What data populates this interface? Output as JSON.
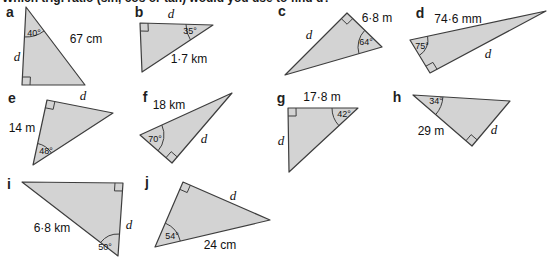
{
  "question_text": "Which trig. ratio (sin, cos or tan) would you use to find d?",
  "colors": {
    "triangle_fill": "#d3d3d3",
    "triangle_stroke": "#3d3d3d",
    "letter_color": "#1f1f1f",
    "label_color": "#111111"
  },
  "figure": {
    "right_angle_mark_size": 8,
    "triangles": [
      {
        "letter": "a",
        "letter_pos": [
          10,
          12
        ],
        "points": [
          [
            26,
            7
          ],
          [
            22,
            85
          ],
          [
            85,
            85
          ]
        ],
        "right_angle_vertex": 1,
        "angle": {
          "vertex": 0,
          "label": "40°",
          "label_pos": [
            34,
            33
          ],
          "radius": 30
        },
        "side_labels": [
          {
            "text": "67 cm",
            "pos": [
              86,
              39
            ],
            "italic": false
          },
          {
            "text": "d",
            "pos": [
              17,
              56
            ],
            "italic": true
          }
        ]
      },
      {
        "letter": "b",
        "letter_pos": [
          139,
          12
        ],
        "points": [
          [
            140,
            23
          ],
          [
            213,
            25
          ],
          [
            142,
            72
          ]
        ],
        "right_angle_vertex": 0,
        "angle": {
          "vertex": 1,
          "label": "35°",
          "label_pos": [
            190,
            31
          ],
          "radius": 27
        },
        "side_labels": [
          {
            "text": "d",
            "pos": [
              171,
              13
            ],
            "italic": true
          },
          {
            "text": "1·7 km",
            "pos": [
              189,
              59
            ],
            "italic": false
          }
        ]
      },
      {
        "letter": "c",
        "letter_pos": [
          282,
          11
        ],
        "points": [
          [
            285,
            75
          ],
          [
            347,
            13
          ],
          [
            382,
            47
          ]
        ],
        "right_angle_vertex": 1,
        "angle": {
          "vertex": 2,
          "label": "64°",
          "label_pos": [
            366,
            42
          ],
          "radius": 24
        },
        "side_labels": [
          {
            "text": "6·8 m",
            "pos": [
              377,
              18
            ],
            "italic": false
          },
          {
            "text": "d",
            "pos": [
              309,
              34
            ],
            "italic": true
          }
        ]
      },
      {
        "letter": "d",
        "letter_pos": [
          420,
          13
        ],
        "points": [
          [
            410,
            40
          ],
          [
            546,
            11
          ],
          [
            430,
            73
          ]
        ],
        "right_angle_vertex": 2,
        "angle": {
          "vertex": 0,
          "label": "75°",
          "label_pos": [
            422,
            46
          ],
          "radius": 18
        },
        "side_labels": [
          {
            "text": "74·6 mm",
            "pos": [
              458,
              19
            ],
            "italic": false
          },
          {
            "text": "d",
            "pos": [
              488,
              53
            ],
            "italic": true
          }
        ]
      },
      {
        "letter": "e",
        "letter_pos": [
          12,
          98
        ],
        "points": [
          [
            47,
            100
          ],
          [
            33,
            165
          ],
          [
            113,
            113
          ]
        ],
        "right_angle_vertex": 0,
        "angle": {
          "vertex": 1,
          "label": "48°",
          "label_pos": [
            46,
            151
          ],
          "radius": 22
        },
        "side_labels": [
          {
            "text": "14 m",
            "pos": [
              22,
              128
            ],
            "italic": false
          },
          {
            "text": "d",
            "pos": [
              83,
              95
            ],
            "italic": true
          }
        ]
      },
      {
        "letter": "f",
        "letter_pos": [
          145,
          97
        ],
        "points": [
          [
            140,
            135
          ],
          [
            232,
            93
          ],
          [
            172,
            163
          ]
        ],
        "right_angle_vertex": 2,
        "angle": {
          "vertex": 0,
          "label": "70°",
          "label_pos": [
            155,
            139
          ],
          "radius": 24
        },
        "side_labels": [
          {
            "text": "18 km",
            "pos": [
              169,
              105
            ],
            "italic": false
          },
          {
            "text": "d",
            "pos": [
              204,
              138
            ],
            "italic": true
          }
        ]
      },
      {
        "letter": "g",
        "letter_pos": [
          281,
          98
        ],
        "points": [
          [
            288,
            108
          ],
          [
            358,
            108
          ],
          [
            289,
            172
          ]
        ],
        "right_angle_vertex": 0,
        "angle": {
          "vertex": 1,
          "label": "42°",
          "label_pos": [
            344,
            114
          ],
          "radius": 26
        },
        "side_labels": [
          {
            "text": "17·8 m",
            "pos": [
              322,
              97
            ],
            "italic": false
          },
          {
            "text": "d",
            "pos": [
              281,
              140
            ],
            "italic": true
          }
        ]
      },
      {
        "letter": "h",
        "letter_pos": [
          397,
          97
        ],
        "points": [
          [
            413,
            95
          ],
          [
            510,
            101
          ],
          [
            472,
            146
          ]
        ],
        "right_angle_vertex": 2,
        "angle": {
          "vertex": 0,
          "label": "34°",
          "label_pos": [
            436,
            101
          ],
          "radius": 30
        },
        "side_labels": [
          {
            "text": "29 m",
            "pos": [
              431,
              131
            ],
            "italic": false
          },
          {
            "text": "d",
            "pos": [
              494,
              129
            ],
            "italic": true
          }
        ]
      },
      {
        "letter": "i",
        "letter_pos": [
          9,
          184
        ],
        "points": [
          [
            22,
            182
          ],
          [
            123,
            183
          ],
          [
            118,
            256
          ]
        ],
        "right_angle_vertex": 1,
        "angle": {
          "vertex": 2,
          "label": "50°",
          "label_pos": [
            105,
            247
          ],
          "radius": 22
        },
        "side_labels": [
          {
            "text": "6·8 km",
            "pos": [
              52,
              228
            ],
            "italic": false
          },
          {
            "text": "d",
            "pos": [
              129,
              224
            ],
            "italic": true
          }
        ]
      },
      {
        "letter": "j",
        "letter_pos": [
          147,
          182
        ],
        "points": [
          [
            183,
            182
          ],
          [
            270,
            220
          ],
          [
            155,
            247
          ]
        ],
        "right_angle_vertex": 0,
        "angle": {
          "vertex": 2,
          "label": "54°",
          "label_pos": [
            172,
            236
          ],
          "radius": 26
        },
        "side_labels": [
          {
            "text": "24 cm",
            "pos": [
              220,
              245
            ],
            "italic": false
          },
          {
            "text": "d",
            "pos": [
              233,
              195
            ],
            "italic": true
          }
        ]
      }
    ]
  }
}
